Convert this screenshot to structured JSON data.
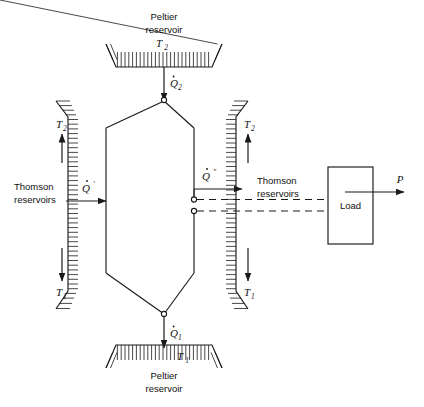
{
  "figure": {
    "background_color": "#ffffff",
    "line_color": "#1a1a1a"
  },
  "peltier_top": {
    "name_line1": "Peltier",
    "name_line2": "reservoir",
    "temperature": "T",
    "temperature_sub": "2",
    "heat_symbol": "Q",
    "heat_sub": "2",
    "heat_prime": "",
    "flow_direction": "down"
  },
  "peltier_bottom": {
    "name_line1": "Peltier",
    "name_line2": "reservoir",
    "temperature": "T",
    "temperature_sub": "1",
    "heat_symbol": "Q",
    "heat_sub": "1",
    "heat_prime": "",
    "flow_direction": "down"
  },
  "thomson_left": {
    "name_line1": "Thomson",
    "name_line2": "reservoirs",
    "temp_top": "T",
    "temp_top_sub": "2",
    "temp_bottom": "T",
    "temp_bottom_sub": "1",
    "heat_symbol": "Q",
    "heat_prime": "′",
    "flow_direction": "right"
  },
  "thomson_right": {
    "name_line1": "Thomson",
    "name_line2": "reservoirs",
    "temp_top": "T",
    "temp_top_sub": "2",
    "temp_bottom": "T",
    "temp_bottom_sub": "1",
    "heat_symbol": "Q",
    "heat_prime": "″",
    "flow_direction": "right"
  },
  "load": {
    "label": "Load",
    "power_symbol": "P",
    "power_direction": "right"
  },
  "element": {
    "shape": "hexagon",
    "terminal_count": 4
  }
}
